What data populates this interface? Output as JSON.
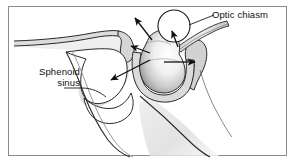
{
  "figure": {
    "background_color": "#ffffff",
    "border_color": "#8d8d8d",
    "line_color": "#1a1a1a",
    "bone_fill_color": "#d9d9d9",
    "bone_edge_color": "#9a9a9a",
    "gland_highlight_color": "#ffffff",
    "gland_shadow_color": "#7d7d7d"
  },
  "labels": {
    "optic_chiasm": "Optic chiasm",
    "sphenoid_sinus_line1": "Sphenoid",
    "sphenoid_sinus_line2": "sinus"
  },
  "structures": [
    {
      "name": "pituitary-gland",
      "description": "central shaded bulb within sella"
    },
    {
      "name": "optic-chiasm-circle",
      "description": "small circle above and right of gland"
    },
    {
      "name": "sphenoid-sinus-cavity",
      "description": "air cavity left of and below sella"
    },
    {
      "name": "sella-floor",
      "description": "bone floor beneath gland"
    },
    {
      "name": "planum-sphenoidale",
      "description": "thin horizontal bone plate upper left"
    },
    {
      "name": "dorsum-sellae",
      "description": "posterior bone projection right of gland"
    },
    {
      "name": "clivus",
      "description": "bone sloping to lower right"
    },
    {
      "name": "optic-nerve-band",
      "description": "diagonal band upper right"
    }
  ],
  "arrows": [
    {
      "name": "arrow-superior-left",
      "direction": "up-left",
      "meaning": "suprasellar extension"
    },
    {
      "name": "arrow-into-chiasm",
      "direction": "up-right",
      "meaning": "extension toward optic chiasm"
    },
    {
      "name": "arrow-anterior-left",
      "direction": "up-left",
      "meaning": "anterior extension"
    },
    {
      "name": "arrow-inferior-left",
      "direction": "down-left",
      "meaning": "extension into sphenoid sinus"
    },
    {
      "name": "arrow-lateral-right",
      "direction": "right",
      "meaning": "lateral cavernous extension"
    }
  ],
  "leader_lines": [
    {
      "name": "leader-optic-chiasm",
      "from": "label",
      "to": "optic-chiasm-circle"
    },
    {
      "name": "leader-sphenoid-sinus",
      "from": "label",
      "to": "sphenoid-sinus-cavity"
    }
  ]
}
